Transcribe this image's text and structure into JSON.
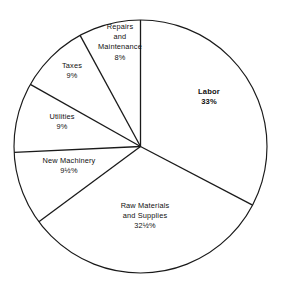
{
  "chart_data": {
    "type": "pie",
    "title": "",
    "subtitle": "",
    "xlabel": "",
    "ylabel": "",
    "legend": "none",
    "grid": false,
    "total_percent": 101,
    "units": "percent",
    "start_angle_deg": 0,
    "direction": "clockwise",
    "categories": [
      "Labor",
      "Raw Materials and Supplies",
      "New Machinery",
      "Utilities",
      "Taxes",
      "Repairs and Maintenance"
    ],
    "values": [
      33,
      32.5,
      9.5,
      9,
      9,
      8
    ],
    "value_labels": [
      "33%",
      "32½%",
      "9½%",
      "9%",
      "9%",
      "8%"
    ],
    "slices": [
      {
        "name": "Labor",
        "name_lines": [
          "Labor"
        ],
        "value": 33,
        "value_label": "33%",
        "emphasis": true,
        "label_x": 209,
        "label_y": 97
      },
      {
        "name": "Raw Materials and Supplies",
        "name_lines": [
          "Raw Materials",
          "and Supplies"
        ],
        "value": 32.5,
        "value_label": "32½%",
        "emphasis": false,
        "label_x": 145,
        "label_y": 216
      },
      {
        "name": "New Machinery",
        "name_lines": [
          "New Machinery"
        ],
        "value": 9.5,
        "value_label": "9½%",
        "emphasis": false,
        "label_x": 69,
        "label_y": 166
      },
      {
        "name": "Utilities",
        "name_lines": [
          "Utilities"
        ],
        "value": 9,
        "value_label": "9%",
        "emphasis": false,
        "label_x": 62,
        "label_y": 122
      },
      {
        "name": "Taxes",
        "name_lines": [
          "Taxes"
        ],
        "value": 9,
        "value_label": "9%",
        "emphasis": false,
        "label_x": 72,
        "label_y": 71
      },
      {
        "name": "Repairs and Maintenance",
        "name_lines": [
          "Repairs",
          "and",
          "Maintenance"
        ],
        "value": 8,
        "value_label": "8%",
        "emphasis": false,
        "label_x": 120,
        "label_y": 42
      }
    ],
    "geometry": {
      "center_x": 140.5,
      "center_y": 146.5,
      "radius": 126.5
    },
    "colors": {
      "background": "#ffffff",
      "stroke": "#1a1a1a",
      "slice_fill": "#ffffff",
      "text": "#101010"
    }
  }
}
